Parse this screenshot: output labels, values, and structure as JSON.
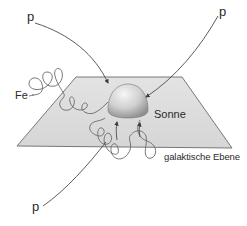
{
  "diagram": {
    "labels": {
      "p_top_left": "p",
      "p_top_right": "p",
      "p_bottom_left": "p",
      "fe": "Fe",
      "sun": "Sonne",
      "plane": "galaktische Ebene"
    },
    "colors": {
      "plane_fill": "#dcdcdc",
      "plane_edge": "#6a6a6a",
      "path_stroke": "#5a5a5a",
      "sun_light": "#f4f4f4",
      "sun_dark": "#9a9a9a",
      "text": "#2a2a2a"
    }
  }
}
